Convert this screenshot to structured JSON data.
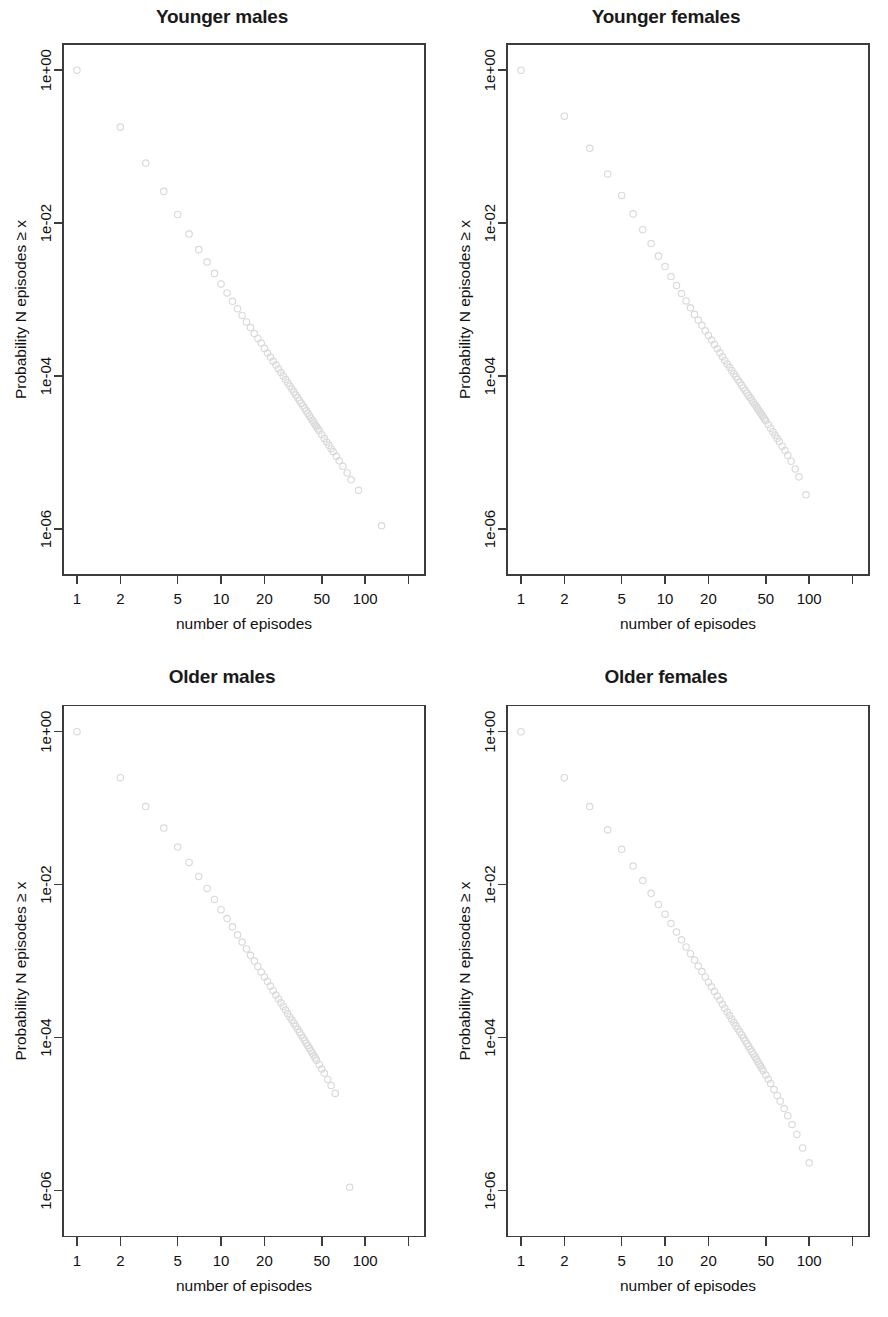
{
  "figure": {
    "panel_count": 4,
    "marker_color": "#d9d9d9",
    "axis_color": "#3c3c3c",
    "title_color": "#1a1a1a"
  },
  "axes": {
    "xlabel": "number of episodes",
    "ylabel": "Probability N episodes ≥ x",
    "x_ticks": [
      {
        "value": 1,
        "label": "1"
      },
      {
        "value": 2,
        "label": "2"
      },
      {
        "value": 5,
        "label": "5"
      },
      {
        "value": 10,
        "label": "10"
      },
      {
        "value": 20,
        "label": "20"
      },
      {
        "value": 50,
        "label": "50"
      },
      {
        "value": 100,
        "label": "100"
      },
      {
        "value": 200,
        "label": ""
      }
    ],
    "y_ticks": [
      {
        "value": 1,
        "label": "1e+00"
      },
      {
        "value": 0.01,
        "label": "1e-02"
      },
      {
        "value": 0.0001,
        "label": "1e-04"
      },
      {
        "value": 1e-06,
        "label": "1e-06"
      }
    ],
    "xlim": [
      0.8,
      260
    ],
    "ylim": [
      2.5e-07,
      2.2
    ],
    "xscale": "log",
    "yscale": "log",
    "grid": false
  },
  "chart_data": [
    {
      "type": "scatter",
      "title": "Younger males",
      "xlabel": "number of episodes",
      "ylabel": "Probability N episodes ≥ x",
      "xscale": "log",
      "yscale": "log",
      "xlim": [
        0.8,
        260
      ],
      "ylim": [
        2.5e-07,
        2.2
      ],
      "marker": "open-circle",
      "series_name": "CCDF younger males",
      "x": [
        1,
        2,
        3,
        4,
        5,
        6,
        7,
        8,
        9,
        10,
        11,
        12,
        13,
        14,
        15,
        16,
        17,
        18,
        19,
        20,
        21,
        22,
        23,
        24,
        25,
        26,
        27,
        28,
        29,
        30,
        31,
        32,
        33,
        34,
        35,
        36,
        37,
        38,
        39,
        40,
        41,
        42,
        43,
        44,
        45,
        46,
        47,
        48,
        50,
        52,
        54,
        56,
        58,
        60,
        63,
        66,
        70,
        75,
        80,
        90,
        130
      ],
      "y": [
        1.0,
        0.18,
        0.061,
        0.026,
        0.013,
        0.0072,
        0.0045,
        0.0031,
        0.0022,
        0.0016,
        0.00122,
        0.00095,
        0.00076,
        0.00062,
        0.00051,
        0.00043,
        0.00036,
        0.00031,
        0.00027,
        0.00023,
        0.0002,
        0.000177,
        0.000156,
        0.000139,
        0.000124,
        0.000111,
        0.0001,
        9e-05,
        8.15e-05,
        7.4e-05,
        6.75e-05,
        6.17e-05,
        5.65e-05,
        5.19e-05,
        4.78e-05,
        4.41e-05,
        4.08e-05,
        3.78e-05,
        3.5e-05,
        3.26e-05,
        3.03e-05,
        2.83e-05,
        2.64e-05,
        2.47e-05,
        2.31e-05,
        2.17e-05,
        2.04e-05,
        1.92e-05,
        1.71e-05,
        1.53e-05,
        1.37e-05,
        1.24e-05,
        1.12e-05,
        1.02e-05,
        8.9e-06,
        7.8e-06,
        6.6e-06,
        5.4e-06,
        4.4e-06,
        3.2e-06,
        1.1e-06
      ]
    },
    {
      "type": "scatter",
      "title": "Younger females",
      "xlabel": "number of episodes",
      "ylabel": "Probability N episodes ≥ x",
      "xscale": "log",
      "yscale": "log",
      "xlim": [
        0.8,
        260
      ],
      "ylim": [
        2.5e-07,
        2.2
      ],
      "marker": "open-circle",
      "series_name": "CCDF younger females",
      "x": [
        1,
        2,
        3,
        4,
        5,
        6,
        7,
        8,
        9,
        10,
        11,
        12,
        13,
        14,
        15,
        16,
        17,
        18,
        19,
        20,
        21,
        22,
        23,
        24,
        25,
        26,
        27,
        28,
        29,
        30,
        31,
        32,
        33,
        34,
        35,
        36,
        37,
        38,
        39,
        40,
        41,
        42,
        43,
        44,
        45,
        46,
        47,
        48,
        49,
        50,
        52,
        54,
        56,
        58,
        60,
        62,
        65,
        68,
        71,
        75,
        80,
        85,
        95
      ],
      "y": [
        1.0,
        0.25,
        0.095,
        0.044,
        0.023,
        0.0132,
        0.0082,
        0.0054,
        0.0037,
        0.0027,
        0.002,
        0.00153,
        0.0012,
        0.00096,
        0.00078,
        0.00064,
        0.00054,
        0.00046,
        0.00039,
        0.00034,
        0.000295,
        0.000258,
        0.000227,
        0.000201,
        0.000179,
        0.00016,
        0.000144,
        0.00013,
        0.000118,
        0.000107,
        9.77e-05,
        8.95e-05,
        8.22e-05,
        7.57e-05,
        6.99e-05,
        6.47e-05,
        6e-05,
        5.58e-05,
        5.19e-05,
        4.84e-05,
        4.52e-05,
        4.23e-05,
        3.96e-05,
        3.72e-05,
        3.49e-05,
        3.28e-05,
        3.09e-05,
        2.91e-05,
        2.75e-05,
        2.6e-05,
        2.32e-05,
        2.08e-05,
        1.87e-05,
        1.69e-05,
        1.53e-05,
        1.39e-05,
        1.21e-05,
        1.06e-05,
        9.2e-06,
        7.7e-06,
        6.1e-06,
        4.8e-06,
        2.8e-06
      ]
    },
    {
      "type": "scatter",
      "title": "Older males",
      "xlabel": "number of episodes",
      "ylabel": "Probability N episodes ≥ x",
      "xscale": "log",
      "yscale": "log",
      "xlim": [
        0.8,
        260
      ],
      "ylim": [
        2.5e-07,
        2.2
      ],
      "marker": "open-circle",
      "series_name": "CCDF older males",
      "x": [
        1,
        2,
        3,
        4,
        5,
        6,
        7,
        8,
        9,
        10,
        11,
        12,
        13,
        14,
        15,
        16,
        17,
        18,
        19,
        20,
        21,
        22,
        23,
        24,
        25,
        26,
        27,
        28,
        29,
        30,
        31,
        32,
        33,
        34,
        35,
        36,
        37,
        38,
        39,
        40,
        41,
        42,
        43,
        44,
        45,
        46,
        48,
        50,
        52,
        55,
        58,
        62,
        78
      ],
      "y": [
        1.0,
        0.25,
        0.105,
        0.055,
        0.031,
        0.0195,
        0.0128,
        0.0089,
        0.0064,
        0.0047,
        0.0036,
        0.0028,
        0.0022,
        0.00177,
        0.00144,
        0.00119,
        0.001,
        0.00085,
        0.00072,
        0.00062,
        0.00054,
        0.00047,
        0.00041,
        0.00036,
        0.00032,
        0.000285,
        0.000255,
        0.000229,
        0.000206,
        0.000186,
        0.000169,
        0.000154,
        0.00014,
        0.000128,
        0.000117,
        0.000108,
        9.91e-05,
        9.13e-05,
        8.43e-05,
        7.8e-05,
        7.23e-05,
        6.71e-05,
        6.24e-05,
        5.81e-05,
        5.42e-05,
        5.05e-05,
        4.41e-05,
        3.87e-05,
        3.41e-05,
        2.83e-05,
        2.36e-05,
        1.86e-05,
        1.1e-06
      ]
    },
    {
      "type": "scatter",
      "title": "Older females",
      "xlabel": "number of episodes",
      "ylabel": "Probability N episodes ≥ x",
      "xscale": "log",
      "yscale": "log",
      "xlim": [
        0.8,
        260
      ],
      "ylim": [
        2.5e-07,
        2.2
      ],
      "marker": "open-circle",
      "series_name": "CCDF older females",
      "x": [
        1,
        2,
        3,
        4,
        5,
        6,
        7,
        8,
        9,
        10,
        11,
        12,
        13,
        14,
        15,
        16,
        17,
        18,
        19,
        20,
        21,
        22,
        23,
        24,
        25,
        26,
        27,
        28,
        29,
        30,
        31,
        32,
        33,
        34,
        35,
        36,
        37,
        38,
        39,
        40,
        41,
        42,
        43,
        44,
        45,
        46,
        47,
        48,
        50,
        52,
        54,
        57,
        60,
        63,
        67,
        71,
        76,
        82,
        90,
        100
      ],
      "y": [
        1.0,
        0.25,
        0.105,
        0.052,
        0.029,
        0.0175,
        0.0113,
        0.0077,
        0.0055,
        0.0041,
        0.0031,
        0.0024,
        0.0019,
        0.00153,
        0.00125,
        0.00103,
        0.00086,
        0.00073,
        0.00062,
        0.00053,
        0.00046,
        0.0004,
        0.00035,
        0.00031,
        0.000272,
        0.000242,
        0.000216,
        0.000194,
        0.000174,
        0.000157,
        0.000142,
        0.000129,
        0.000118,
        0.000108,
        9.86e-05,
        9.05e-05,
        8.32e-05,
        7.66e-05,
        7.07e-05,
        6.54e-05,
        6.06e-05,
        5.62e-05,
        5.22e-05,
        4.86e-05,
        4.52e-05,
        4.22e-05,
        3.94e-05,
        3.68e-05,
        3.23e-05,
        2.84e-05,
        2.51e-05,
        2.09e-05,
        1.75e-05,
        1.47e-05,
        1.18e-05,
        9.5e-06,
        7.3e-06,
        5.4e-06,
        3.6e-06,
        2.3e-06
      ]
    }
  ]
}
